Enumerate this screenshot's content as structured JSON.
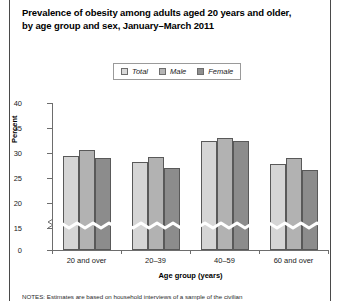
{
  "title": {
    "line1": "Prevalence of obesity among adults aged 20 years and older,",
    "line2": "by age group and sex, January–March 2011"
  },
  "legend": {
    "items": [
      {
        "label": "Total",
        "color": "#d5d5d5"
      },
      {
        "label": "Male",
        "color": "#b2b2b2"
      },
      {
        "label": "Female",
        "color": "#8c8c8c"
      }
    ]
  },
  "note": "NOTES: Estimates are based on household interviews of a sample of the civilian",
  "chart_data": {
    "type": "bar",
    "title": "Prevalence of obesity among adults aged 20 years and older, by age group and sex, January–March 2011",
    "xlabel": "Age group (years)",
    "ylabel": "Percent",
    "categories": [
      "20 and over",
      "20–39",
      "40–59",
      "60 and over"
    ],
    "series": [
      {
        "name": "Total",
        "values": [
          29.5,
          28.3,
          32.5,
          27.8
        ]
      },
      {
        "name": "Male",
        "values": [
          30.6,
          29.3,
          33.0,
          29.0
        ]
      },
      {
        "name": "Female",
        "values": [
          29.0,
          27.0,
          32.4,
          26.6
        ]
      }
    ],
    "ylim": [
      0,
      40
    ],
    "yticks": [
      0,
      15,
      20,
      25,
      30,
      35,
      40
    ],
    "ytick_labels": [
      "0",
      "15",
      "20",
      "25",
      "30",
      "35",
      "40"
    ],
    "axis_break": {
      "between": [
        0,
        15
      ],
      "style": "zigzag"
    },
    "grid": false,
    "legend_position": "top-center"
  }
}
